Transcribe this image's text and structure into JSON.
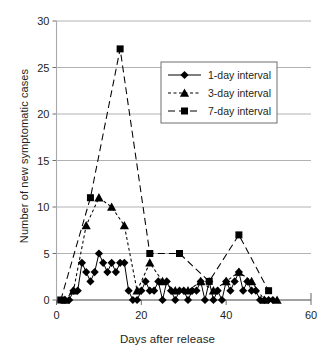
{
  "chart_data": {
    "type": "line",
    "title": "",
    "xlabel": "Days after release",
    "ylabel": "Number of new symptomatic cases",
    "xlim": [
      0,
      60
    ],
    "ylim": [
      0,
      30
    ],
    "xticks": [
      0,
      20,
      40,
      60
    ],
    "yticks": [
      0,
      5,
      10,
      15,
      20,
      25,
      30
    ],
    "xtick_labels": [
      "0",
      "20",
      "40",
      "60"
    ],
    "ytick_labels": [
      "0",
      "5",
      "10",
      "15",
      "20",
      "25",
      "30"
    ],
    "grid": "horizontal",
    "legend_position": "upper-center-right",
    "series": [
      {
        "name": "1-day interval",
        "marker": "diamond",
        "linestyle": "solid",
        "color": "#000000",
        "points": [
          [
            2,
            0
          ],
          [
            3,
            0
          ],
          [
            4,
            1
          ],
          [
            5,
            1
          ],
          [
            6,
            4
          ],
          [
            7,
            3
          ],
          [
            8,
            2
          ],
          [
            9,
            3
          ],
          [
            10,
            5
          ],
          [
            11,
            4
          ],
          [
            12,
            3
          ],
          [
            13,
            4
          ],
          [
            14,
            3
          ],
          [
            15,
            4
          ],
          [
            16,
            4
          ],
          [
            17,
            1
          ],
          [
            18,
            0
          ],
          [
            19,
            0
          ],
          [
            20,
            1
          ],
          [
            21,
            2
          ],
          [
            22,
            1
          ],
          [
            23,
            1
          ],
          [
            24,
            2
          ],
          [
            25,
            0
          ],
          [
            26,
            2
          ],
          [
            27,
            1
          ],
          [
            28,
            0
          ],
          [
            29,
            1
          ],
          [
            30,
            1
          ],
          [
            31,
            0
          ],
          [
            32,
            1
          ],
          [
            33,
            1
          ],
          [
            34,
            2
          ],
          [
            35,
            0
          ],
          [
            36,
            2
          ],
          [
            37,
            0
          ],
          [
            38,
            1
          ],
          [
            39,
            0
          ],
          [
            40,
            2
          ],
          [
            41,
            1
          ],
          [
            42,
            2
          ],
          [
            43,
            3
          ],
          [
            44,
            1
          ],
          [
            45,
            2
          ],
          [
            46,
            1
          ],
          [
            47,
            1
          ],
          [
            48,
            0
          ],
          [
            49,
            0
          ],
          [
            50,
            0
          ],
          [
            51,
            0
          ]
        ]
      },
      {
        "name": "3-day interval",
        "marker": "triangle",
        "linestyle": "dashed",
        "color": "#000000",
        "points": [
          [
            2,
            0
          ],
          [
            4,
            1
          ],
          [
            7,
            8
          ],
          [
            10,
            11
          ],
          [
            13,
            10
          ],
          [
            16,
            8
          ],
          [
            19,
            1
          ],
          [
            22,
            4
          ],
          [
            25,
            2
          ],
          [
            28,
            1
          ],
          [
            31,
            1
          ],
          [
            34,
            2
          ],
          [
            37,
            1
          ],
          [
            40,
            2
          ],
          [
            43,
            3
          ],
          [
            46,
            2
          ],
          [
            49,
            0
          ],
          [
            52,
            0
          ]
        ]
      },
      {
        "name": "7-day interval",
        "marker": "square",
        "linestyle": "long-dash",
        "color": "#000000",
        "points": [
          [
            1,
            0
          ],
          [
            8,
            11
          ],
          [
            15,
            27
          ],
          [
            22,
            5
          ],
          [
            29,
            5
          ],
          [
            36,
            2
          ],
          [
            43,
            7
          ],
          [
            50,
            1
          ]
        ]
      }
    ]
  },
  "legend": {
    "items": [
      {
        "label": "1-day interval"
      },
      {
        "label": "3-day interval"
      },
      {
        "label": "7-day interval"
      }
    ]
  }
}
